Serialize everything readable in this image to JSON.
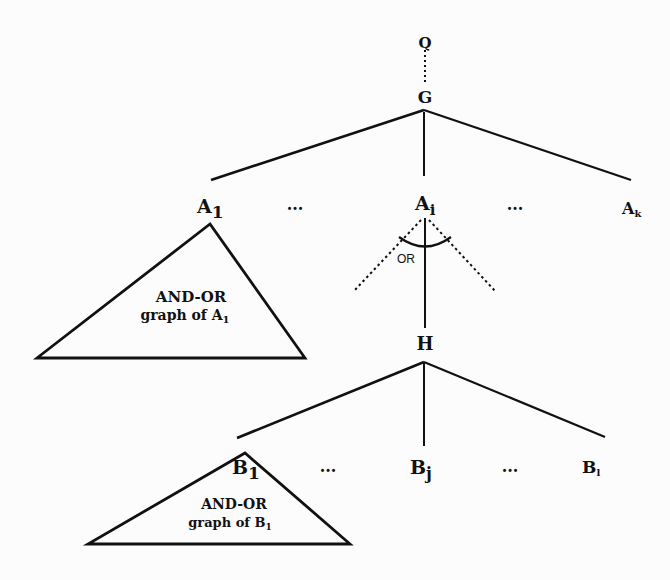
{
  "diagram": {
    "nodes": {
      "q": "Q",
      "g": "G",
      "a1": "A",
      "a1_sub": "1",
      "ai": "A",
      "ai_sub": "i",
      "ak": "A",
      "ak_sub": "k",
      "h": "H",
      "b1": "B",
      "b1_sub": "1",
      "bj": "B",
      "bj_sub": "j",
      "bl": "B",
      "bl_sub": "l"
    },
    "ellipsis": "...",
    "or_label": "OR",
    "subgraph_a1": {
      "line1": "AND-OR",
      "line2": "graph of A",
      "sub": "1"
    },
    "subgraph_b1": {
      "line1": "AND-OR",
      "line2": "graph of B",
      "sub": "1"
    },
    "edges": [
      {
        "from": "Q",
        "to": "G",
        "style": "dotted"
      },
      {
        "from": "G",
        "to": "A1",
        "style": "solid"
      },
      {
        "from": "G",
        "to": "Ai",
        "style": "solid"
      },
      {
        "from": "G",
        "to": "Ak",
        "style": "solid"
      },
      {
        "from": "Ai",
        "to": "H",
        "style": "solid",
        "or_branch": true
      },
      {
        "from": "Ai",
        "to": "left-alternative",
        "style": "dotted",
        "or_branch": true
      },
      {
        "from": "Ai",
        "to": "right-alternative",
        "style": "dotted",
        "or_branch": true
      },
      {
        "from": "H",
        "to": "B1",
        "style": "solid"
      },
      {
        "from": "H",
        "to": "Bj",
        "style": "solid"
      },
      {
        "from": "H",
        "to": "Bl",
        "style": "solid"
      }
    ]
  }
}
